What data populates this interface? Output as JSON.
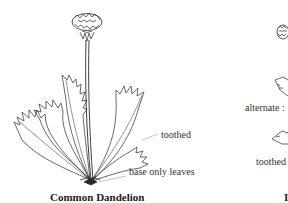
{
  "left_figure": {
    "title": "Common Dandelion",
    "annotations": {
      "toothed": "toothed",
      "base_leaves": "base only leaves"
    }
  },
  "right_figure": {
    "title_partial": "I",
    "annotations": {
      "alternate": "alternate :",
      "toothed": "toothed"
    }
  },
  "colors": {
    "ink": "#2a2a2a",
    "background": "#ffffff",
    "leader_line": "#9a9a9a"
  }
}
